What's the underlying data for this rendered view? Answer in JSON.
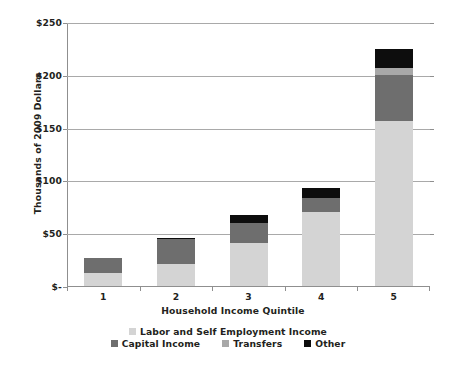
{
  "chart_data": {
    "type": "bar",
    "subtype": "stacked-vertical",
    "title": "",
    "xlabel": "Household Income Quintile",
    "ylabel": "Thousands of 2009 Dollars",
    "categories": [
      "1",
      "2",
      "3",
      "4",
      "5"
    ],
    "ylim": [
      0,
      250
    ],
    "ytick_labels": [
      "$-",
      "$50",
      "$100",
      "$150",
      "$200",
      "$250"
    ],
    "ytick_values": [
      0,
      50,
      100,
      150,
      200,
      250
    ],
    "grid": "horizontal",
    "legend_position": "bottom",
    "series": [
      {
        "name": "Labor and Self Employment Income",
        "color": "#d4d4d4",
        "values": [
          12.3,
          20.8,
          40.7,
          70.0,
          156.2
        ]
      },
      {
        "name": "Capital Income",
        "color": "#6e6e6e",
        "values": [
          14.2,
          23.7,
          19.0,
          13.3,
          43.6
        ]
      },
      {
        "name": "Transfers",
        "color": "#a8a8a8",
        "values": [
          0.0,
          0.0,
          0.0,
          0.0,
          6.6
        ]
      },
      {
        "name": "Other",
        "color": "#0d0d0d",
        "values": [
          0.0,
          1.2,
          7.3,
          9.5,
          18.0
        ]
      }
    ],
    "totals": [
      26.5,
      45.7,
      67.0,
      92.8,
      224.4
    ]
  },
  "axes": {
    "y_title": "Thousands of 2009 Dollars",
    "x_title": "Household Income Quintile",
    "y_ticks": [
      {
        "label": "$250",
        "value": 250
      },
      {
        "label": "$200",
        "value": 200
      },
      {
        "label": "$150",
        "value": 150
      },
      {
        "label": "$100",
        "value": 100
      },
      {
        "label": "$50",
        "value": 50
      },
      {
        "label": "$-",
        "value": 0
      }
    ],
    "x_ticks": [
      "1",
      "2",
      "3",
      "4",
      "5"
    ]
  },
  "legend": {
    "row_1": [
      {
        "label": "Labor and Self Employment Income",
        "color": "#d4d4d4"
      }
    ],
    "row_2": [
      {
        "label": "Capital Income",
        "color": "#6e6e6e"
      },
      {
        "label": "Transfers",
        "color": "#a8a8a8"
      },
      {
        "label": "Other",
        "color": "#0d0d0d"
      }
    ]
  },
  "style": {
    "gridline_color": "#a9a9a9",
    "axis_color": "#8f8f8f",
    "text_color": "#231f20",
    "background": "#ffffff"
  }
}
